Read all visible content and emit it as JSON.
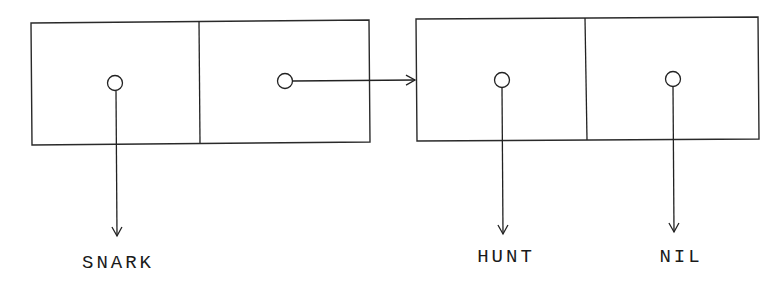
{
  "diagram": {
    "title": "",
    "type": "cons-cell linked list",
    "colors": {
      "stroke": "#222222",
      "background": "#ffffff"
    },
    "cells": [
      {
        "id": "cell-1",
        "car": {
          "points_to": "SNARK"
        },
        "cdr": {
          "points_to": "cell-2"
        }
      },
      {
        "id": "cell-2",
        "car": {
          "points_to": "HUNT"
        },
        "cdr": {
          "points_to": "NIL"
        }
      }
    ],
    "labels": {
      "snark": "SNARK",
      "hunt": "HUNT",
      "nil": "NIL"
    }
  }
}
